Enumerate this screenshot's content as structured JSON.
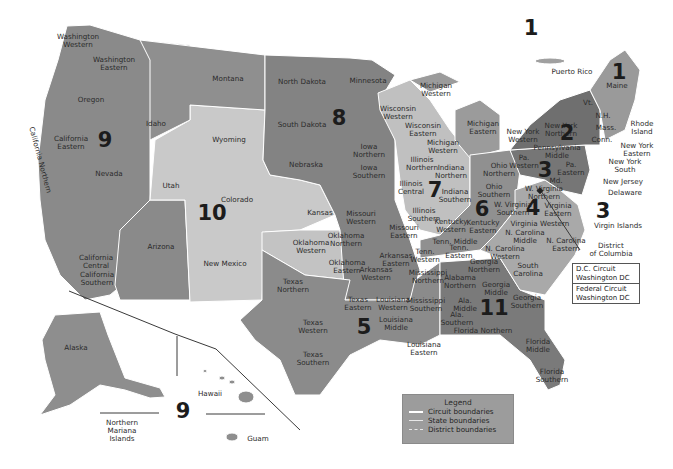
{
  "colors": {
    "dark": "#7d7d7d",
    "medium": "#8f8f8f",
    "light": "#b9b9b9",
    "lightest": "#cfcfcf",
    "background": "#ffffff",
    "boundary": "#ffffff"
  },
  "circuit_numbers": [
    {
      "id": "1",
      "label": "1",
      "x": 531,
      "y": 28
    },
    {
      "id": "1b",
      "label": "1",
      "x": 619,
      "y": 72
    },
    {
      "id": "2",
      "label": "2",
      "x": 567,
      "y": 133
    },
    {
      "id": "3",
      "label": "3",
      "x": 545,
      "y": 170
    },
    {
      "id": "3b",
      "label": "3",
      "x": 603,
      "y": 211
    },
    {
      "id": "4",
      "label": "4",
      "x": 533,
      "y": 208
    },
    {
      "id": "5",
      "label": "5",
      "x": 364,
      "y": 327
    },
    {
      "id": "6",
      "label": "6",
      "x": 482,
      "y": 209
    },
    {
      "id": "7",
      "label": "7",
      "x": 435,
      "y": 190
    },
    {
      "id": "8",
      "label": "8",
      "x": 339,
      "y": 118
    },
    {
      "id": "9",
      "label": "9",
      "x": 105,
      "y": 140
    },
    {
      "id": "9b",
      "label": "9",
      "x": 183,
      "y": 411
    },
    {
      "id": "10",
      "label": "10",
      "x": 212,
      "y": 213
    },
    {
      "id": "11",
      "label": "11",
      "x": 494,
      "y": 308
    }
  ],
  "district_labels": [
    {
      "text": "Washington\nWestern",
      "x": 78,
      "y": 41
    },
    {
      "text": "Washington\nEastern",
      "x": 114,
      "y": 64
    },
    {
      "text": "Montana",
      "x": 228,
      "y": 79
    },
    {
      "text": "Oregon",
      "x": 91,
      "y": 100
    },
    {
      "text": "Idaho",
      "x": 156,
      "y": 124
    },
    {
      "text": "California\nEastern",
      "x": 71,
      "y": 143
    },
    {
      "text": "California Northern",
      "x": 40,
      "y": 160,
      "rotate": true
    },
    {
      "text": "Nevada",
      "x": 109,
      "y": 174
    },
    {
      "text": "California\nCentral",
      "x": 96,
      "y": 262
    },
    {
      "text": "California\nSouthern",
      "x": 97,
      "y": 279
    },
    {
      "text": "Wyoming",
      "x": 229,
      "y": 140
    },
    {
      "text": "Utah",
      "x": 171,
      "y": 186
    },
    {
      "text": "Colorado",
      "x": 237,
      "y": 200
    },
    {
      "text": "Arizona",
      "x": 161,
      "y": 247
    },
    {
      "text": "New Mexico",
      "x": 225,
      "y": 264
    },
    {
      "text": "North Dakota",
      "x": 302,
      "y": 82
    },
    {
      "text": "South Dakota",
      "x": 302,
      "y": 125
    },
    {
      "text": "Minnesota",
      "x": 368,
      "y": 81
    },
    {
      "text": "Nebraska",
      "x": 306,
      "y": 165
    },
    {
      "text": "Kansas",
      "x": 320,
      "y": 213
    },
    {
      "text": "Iowa\nNorthern",
      "x": 369,
      "y": 151
    },
    {
      "text": "Iowa\nSouthern",
      "x": 369,
      "y": 172
    },
    {
      "text": "Wisconsin\nWestern",
      "x": 398,
      "y": 113
    },
    {
      "text": "Wisconsin\nEastern",
      "x": 423,
      "y": 130
    },
    {
      "text": "Michigan\nWestern",
      "x": 436,
      "y": 90
    },
    {
      "text": "Michigan\nEastern",
      "x": 483,
      "y": 128
    },
    {
      "text": "Michigan\nWestern",
      "x": 443,
      "y": 147
    },
    {
      "text": "Illinois\nNorthern",
      "x": 422,
      "y": 164
    },
    {
      "text": "Illinois\nCentral",
      "x": 411,
      "y": 188
    },
    {
      "text": "Illinois\nSouthern",
      "x": 424,
      "y": 215
    },
    {
      "text": "Indiana\nNorthern",
      "x": 451,
      "y": 172
    },
    {
      "text": "Indiana\nSouthern",
      "x": 455,
      "y": 196
    },
    {
      "text": "Ohio\nNorthern",
      "x": 499,
      "y": 170
    },
    {
      "text": "Ohio\nSouthern",
      "x": 494,
      "y": 191
    },
    {
      "text": "Missouri\nWestern",
      "x": 361,
      "y": 218
    },
    {
      "text": "Missouri\nEastern",
      "x": 404,
      "y": 232
    },
    {
      "text": "Kentucky\nWestern",
      "x": 451,
      "y": 226
    },
    {
      "text": "Kentucky\nEastern",
      "x": 483,
      "y": 227
    },
    {
      "text": "Oklahoma\nNorthern",
      "x": 346,
      "y": 240
    },
    {
      "text": "Oklahoma\nWestern",
      "x": 311,
      "y": 247
    },
    {
      "text": "Oklahoma\nEastern",
      "x": 347,
      "y": 267
    },
    {
      "text": "Arkansas\nEastern",
      "x": 396,
      "y": 260
    },
    {
      "text": "Arkansas\nWestern",
      "x": 376,
      "y": 274
    },
    {
      "text": "Tenn.\nWestern",
      "x": 425,
      "y": 256
    },
    {
      "text": "Tenn. Middle",
      "x": 455,
      "y": 242
    },
    {
      "text": "Tenn.\nEastern",
      "x": 459,
      "y": 252
    },
    {
      "text": "Texas\nNorthern",
      "x": 293,
      "y": 286
    },
    {
      "text": "Texas\nEastern",
      "x": 358,
      "y": 304
    },
    {
      "text": "Texas\nWestern",
      "x": 313,
      "y": 327
    },
    {
      "text": "Texas\nSouthern",
      "x": 313,
      "y": 359
    },
    {
      "text": "Louisiana\nWestern",
      "x": 393,
      "y": 304
    },
    {
      "text": "Louisiana\nMiddle",
      "x": 396,
      "y": 324
    },
    {
      "text": "Louisiana\nEastern",
      "x": 424,
      "y": 349
    },
    {
      "text": "Mississippi\nNorthern",
      "x": 428,
      "y": 277
    },
    {
      "text": "Mississippi\nSouthern",
      "x": 426,
      "y": 305
    },
    {
      "text": "Alabama\nNorthern",
      "x": 460,
      "y": 282
    },
    {
      "text": "Ala.\nMiddle",
      "x": 465,
      "y": 305
    },
    {
      "text": "Ala.\nSouthern",
      "x": 457,
      "y": 319
    },
    {
      "text": "Georgia\nNorthern",
      "x": 484,
      "y": 266
    },
    {
      "text": "Georgia\nMiddle",
      "x": 496,
      "y": 289
    },
    {
      "text": "Georgia\nSouthern",
      "x": 527,
      "y": 302
    },
    {
      "text": "Florida Northern",
      "x": 483,
      "y": 331
    },
    {
      "text": "Florida\nMiddle",
      "x": 538,
      "y": 346
    },
    {
      "text": "Florida\nSouthern",
      "x": 552,
      "y": 376
    },
    {
      "text": "W. Virginia\nNorthern",
      "x": 544,
      "y": 193
    },
    {
      "text": "W. Virginia\nSouthern",
      "x": 513,
      "y": 209
    },
    {
      "text": "Virginia Western",
      "x": 540,
      "y": 224
    },
    {
      "text": "Virginia\nEastern",
      "x": 558,
      "y": 210
    },
    {
      "text": "N. Carolina\nMiddle",
      "x": 525,
      "y": 237
    },
    {
      "text": "N. Carolina\nEastern",
      "x": 566,
      "y": 245
    },
    {
      "text": "N. Carolina\nWestern",
      "x": 505,
      "y": 253
    },
    {
      "text": "South\nCarolina",
      "x": 528,
      "y": 270
    },
    {
      "text": "New York\nWestern",
      "x": 523,
      "y": 136
    },
    {
      "text": "New York\nNorthern",
      "x": 561,
      "y": 130
    },
    {
      "text": "Pennsylvania\nMiddle",
      "x": 557,
      "y": 152
    },
    {
      "text": "Pa.\nWestern",
      "x": 524,
      "y": 162
    },
    {
      "text": "Pa.\nEastern",
      "x": 571,
      "y": 169
    },
    {
      "text": "Md.",
      "x": 556,
      "y": 181
    },
    {
      "text": "Vt.",
      "x": 588,
      "y": 103
    },
    {
      "text": "N.H.",
      "x": 603,
      "y": 116
    },
    {
      "text": "Maine",
      "x": 617,
      "y": 86
    },
    {
      "text": "Mass.",
      "x": 606,
      "y": 128
    },
    {
      "text": "Conn.",
      "x": 602,
      "y": 140
    },
    {
      "text": "Rhode\nIsland",
      "x": 642,
      "y": 128
    },
    {
      "text": "New York\nEastern",
      "x": 637,
      "y": 150
    },
    {
      "text": "New York\nSouth",
      "x": 625,
      "y": 166
    },
    {
      "text": "New Jersey",
      "x": 623,
      "y": 182
    },
    {
      "text": "Delaware",
      "x": 625,
      "y": 193
    },
    {
      "text": "Puerto Rico",
      "x": 572,
      "y": 72
    },
    {
      "text": "Virgin Islands",
      "x": 618,
      "y": 226
    },
    {
      "text": "District\nof Columbia",
      "x": 611,
      "y": 250
    },
    {
      "text": "Alaska",
      "x": 76,
      "y": 348
    },
    {
      "text": "Hawaii",
      "x": 210,
      "y": 394
    },
    {
      "text": "Northern\nMariana\nIslands",
      "x": 122,
      "y": 431
    },
    {
      "text": "Guam",
      "x": 258,
      "y": 439
    }
  ],
  "circuit_box": {
    "dc": "D.C. Circuit\nWashington DC",
    "federal": "Federal Circuit\nWashington DC"
  },
  "legend": {
    "title": "Legend",
    "items": [
      {
        "label": "Circuit boundaries",
        "style": "circuit"
      },
      {
        "label": "State boundaries",
        "style": "state"
      },
      {
        "label": "District boundaries",
        "style": "dist"
      }
    ]
  }
}
